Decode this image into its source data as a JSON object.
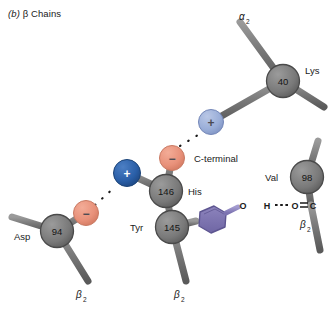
{
  "figure": {
    "panel_letter": "(b)",
    "caption": "β Chains",
    "background": "#ffffff"
  },
  "colors": {
    "bond_gray": "#7c7c7c",
    "bond_gray_dark": "#5d5d5d",
    "node_gray": "#7b7b7b",
    "node_gray_edge": "#4a4a4a",
    "positive_blue": "#2a5fa8",
    "positive_blue_light": "#9aaed8",
    "negative_salmon": "#e8917a",
    "ring_purple": "#7b72b0",
    "ring_purple_edge": "#5d5590",
    "text": "#1a1a1a",
    "hbond": "#1a1a1a"
  },
  "residues": [
    {
      "id": "lys40",
      "name": "Lys",
      "number": "40",
      "chain_label": "α",
      "chain_sub": "2",
      "charge": "+",
      "charge_color": "positive_blue_light"
    },
    {
      "id": "his146",
      "name": "His",
      "number": "146",
      "terminal_label": "C-terminal",
      "charge": "−",
      "charge_color": "negative_salmon"
    },
    {
      "id": "asp94",
      "name": "Asp",
      "number": "94",
      "chain_label": "β",
      "chain_sub": "2",
      "charge": "−",
      "charge_color": "negative_salmon"
    },
    {
      "id": "tyr145",
      "name": "Tyr",
      "number": "145",
      "chain_label": "β",
      "chain_sub": "2"
    },
    {
      "id": "val98",
      "name": "Val",
      "number": "98",
      "chain_label": "β",
      "chain_sub": "2"
    }
  ],
  "free_charges": [
    {
      "id": "free-positive",
      "sign": "+",
      "color": "positive_blue"
    }
  ],
  "atoms": {
    "hydroxyl_o": "O",
    "hydroxyl_h": "H",
    "carbonyl_o": "O",
    "carbonyl_c": "C"
  },
  "bonds": {
    "hydroxyl_label": "O—H",
    "hydrogen_bond_label": "H---O",
    "carbonyl_label": "O=C"
  },
  "interactions": [
    {
      "id": "salt-bridge-his146-lys40",
      "type": "salt-bridge",
      "style": "dotted"
    },
    {
      "id": "salt-bridge-asp94-positive",
      "type": "salt-bridge",
      "style": "dotted"
    },
    {
      "id": "hydrogen-bond-tyr145-val98",
      "type": "hydrogen-bond",
      "style": "dashed"
    }
  ],
  "labels": {
    "lys": "Lys",
    "lys_num": "40",
    "his": "His",
    "his_num": "146",
    "asp": "Asp",
    "asp_num": "94",
    "tyr": "Tyr",
    "tyr_num": "145",
    "val": "Val",
    "val_num": "98",
    "c_terminal": "C-terminal",
    "alpha": "α",
    "beta": "β",
    "sub_two": "2",
    "plus": "+",
    "minus": "−",
    "atom_o1": "O",
    "atom_h": "H",
    "atom_o2": "O",
    "atom_c": "C"
  }
}
